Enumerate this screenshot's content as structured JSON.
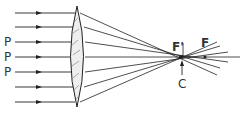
{
  "diagram": {
    "labels": {
      "p1": "P",
      "p2": "P",
      "p3": "P",
      "f_prime": "F'",
      "f": "F",
      "c": "C"
    },
    "colors": {
      "line": "#222222",
      "lens_fill": "#eeeeee"
    }
  }
}
